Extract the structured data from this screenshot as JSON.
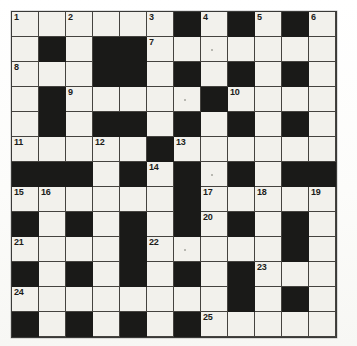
{
  "puzzle": {
    "kind": "crossword-grid",
    "title": "",
    "columns": 12,
    "rows": 13,
    "cell_size_px": 27,
    "colors": {
      "block": "#1a1a18",
      "open": "#f2f1ec",
      "grid_line": "#45433f",
      "page": "#fdfdfb",
      "number_text": "#1c1c1a"
    },
    "legend": {
      "open_cell": "white-cell",
      "block_cell": "black-cell"
    },
    "clue_numbers_present": [
      1,
      2,
      3,
      4,
      5,
      6,
      7,
      8,
      9,
      10,
      11,
      12,
      13,
      14,
      15,
      16,
      17,
      18,
      19,
      20,
      21,
      22,
      23,
      24,
      25
    ],
    "max_clue_number": 25,
    "grid": [
      [
        {
          "b": false,
          "n": "1"
        },
        {
          "b": false,
          "n": ""
        },
        {
          "b": false,
          "n": "2"
        },
        {
          "b": false,
          "n": ""
        },
        {
          "b": false,
          "n": ""
        },
        {
          "b": false,
          "n": "3"
        },
        {
          "b": true,
          "n": ""
        },
        {
          "b": false,
          "n": "4"
        },
        {
          "b": true,
          "n": ""
        },
        {
          "b": false,
          "n": "5"
        },
        {
          "b": true,
          "n": ""
        },
        {
          "b": false,
          "n": "6"
        }
      ],
      [
        {
          "b": false,
          "n": ""
        },
        {
          "b": true,
          "n": ""
        },
        {
          "b": false,
          "n": ""
        },
        {
          "b": true,
          "n": ""
        },
        {
          "b": true,
          "n": ""
        },
        {
          "b": false,
          "n": "7"
        },
        {
          "b": false,
          "n": ""
        },
        {
          "b": false,
          "n": "",
          "s": true
        },
        {
          "b": false,
          "n": ""
        },
        {
          "b": false,
          "n": ""
        },
        {
          "b": false,
          "n": ""
        },
        {
          "b": false,
          "n": ""
        }
      ],
      [
        {
          "b": false,
          "n": "8"
        },
        {
          "b": false,
          "n": ""
        },
        {
          "b": false,
          "n": ""
        },
        {
          "b": true,
          "n": ""
        },
        {
          "b": true,
          "n": ""
        },
        {
          "b": false,
          "n": ""
        },
        {
          "b": true,
          "n": ""
        },
        {
          "b": false,
          "n": ""
        },
        {
          "b": true,
          "n": ""
        },
        {
          "b": false,
          "n": ""
        },
        {
          "b": true,
          "n": ""
        },
        {
          "b": false,
          "n": ""
        }
      ],
      [
        {
          "b": false,
          "n": ""
        },
        {
          "b": true,
          "n": ""
        },
        {
          "b": false,
          "n": "9"
        },
        {
          "b": false,
          "n": ""
        },
        {
          "b": false,
          "n": ""
        },
        {
          "b": false,
          "n": ""
        },
        {
          "b": false,
          "n": "",
          "s": true
        },
        {
          "b": true,
          "n": ""
        },
        {
          "b": false,
          "n": "10"
        },
        {
          "b": false,
          "n": ""
        },
        {
          "b": false,
          "n": ""
        },
        {
          "b": false,
          "n": ""
        }
      ],
      [
        {
          "b": false,
          "n": ""
        },
        {
          "b": true,
          "n": ""
        },
        {
          "b": false,
          "n": ""
        },
        {
          "b": true,
          "n": ""
        },
        {
          "b": true,
          "n": ""
        },
        {
          "b": false,
          "n": ""
        },
        {
          "b": true,
          "n": ""
        },
        {
          "b": false,
          "n": ""
        },
        {
          "b": true,
          "n": ""
        },
        {
          "b": false,
          "n": ""
        },
        {
          "b": true,
          "n": ""
        },
        {
          "b": false,
          "n": ""
        }
      ],
      [
        {
          "b": false,
          "n": "11"
        },
        {
          "b": false,
          "n": ""
        },
        {
          "b": false,
          "n": ""
        },
        {
          "b": false,
          "n": "12"
        },
        {
          "b": false,
          "n": ""
        },
        {
          "b": true,
          "n": ""
        },
        {
          "b": false,
          "n": "13"
        },
        {
          "b": false,
          "n": ""
        },
        {
          "b": false,
          "n": ""
        },
        {
          "b": false,
          "n": ""
        },
        {
          "b": false,
          "n": ""
        },
        {
          "b": false,
          "n": ""
        }
      ],
      [
        {
          "b": true,
          "n": ""
        },
        {
          "b": true,
          "n": ""
        },
        {
          "b": true,
          "n": ""
        },
        {
          "b": false,
          "n": ""
        },
        {
          "b": true,
          "n": ""
        },
        {
          "b": false,
          "n": "14"
        },
        {
          "b": true,
          "n": ""
        },
        {
          "b": false,
          "n": "",
          "s": true
        },
        {
          "b": true,
          "n": ""
        },
        {
          "b": false,
          "n": ""
        },
        {
          "b": true,
          "n": ""
        },
        {
          "b": true,
          "n": ""
        }
      ],
      [
        {
          "b": false,
          "n": "15"
        },
        {
          "b": false,
          "n": "16"
        },
        {
          "b": false,
          "n": ""
        },
        {
          "b": false,
          "n": ""
        },
        {
          "b": false,
          "n": ""
        },
        {
          "b": false,
          "n": ""
        },
        {
          "b": true,
          "n": ""
        },
        {
          "b": false,
          "n": "17"
        },
        {
          "b": false,
          "n": ""
        },
        {
          "b": false,
          "n": "18"
        },
        {
          "b": false,
          "n": ""
        },
        {
          "b": false,
          "n": "19"
        }
      ],
      [
        {
          "b": true,
          "n": ""
        },
        {
          "b": false,
          "n": ""
        },
        {
          "b": true,
          "n": ""
        },
        {
          "b": false,
          "n": ""
        },
        {
          "b": true,
          "n": ""
        },
        {
          "b": false,
          "n": ""
        },
        {
          "b": true,
          "n": ""
        },
        {
          "b": false,
          "n": "20"
        },
        {
          "b": true,
          "n": ""
        },
        {
          "b": false,
          "n": ""
        },
        {
          "b": true,
          "n": ""
        },
        {
          "b": false,
          "n": ""
        }
      ],
      [
        {
          "b": false,
          "n": "21"
        },
        {
          "b": false,
          "n": ""
        },
        {
          "b": false,
          "n": ""
        },
        {
          "b": false,
          "n": ""
        },
        {
          "b": true,
          "n": ""
        },
        {
          "b": false,
          "n": "22"
        },
        {
          "b": false,
          "n": "",
          "s": true
        },
        {
          "b": false,
          "n": ""
        },
        {
          "b": false,
          "n": ""
        },
        {
          "b": false,
          "n": ""
        },
        {
          "b": true,
          "n": ""
        },
        {
          "b": false,
          "n": ""
        }
      ],
      [
        {
          "b": true,
          "n": ""
        },
        {
          "b": false,
          "n": ""
        },
        {
          "b": true,
          "n": ""
        },
        {
          "b": false,
          "n": ""
        },
        {
          "b": true,
          "n": ""
        },
        {
          "b": false,
          "n": ""
        },
        {
          "b": true,
          "n": ""
        },
        {
          "b": false,
          "n": ""
        },
        {
          "b": true,
          "n": ""
        },
        {
          "b": false,
          "n": "23"
        },
        {
          "b": false,
          "n": ""
        },
        {
          "b": false,
          "n": ""
        }
      ],
      [
        {
          "b": false,
          "n": "24"
        },
        {
          "b": false,
          "n": ""
        },
        {
          "b": false,
          "n": ""
        },
        {
          "b": false,
          "n": ""
        },
        {
          "b": false,
          "n": ""
        },
        {
          "b": false,
          "n": ""
        },
        {
          "b": false,
          "n": ""
        },
        {
          "b": false,
          "n": ""
        },
        {
          "b": true,
          "n": ""
        },
        {
          "b": false,
          "n": ""
        },
        {
          "b": true,
          "n": ""
        },
        {
          "b": false,
          "n": ""
        }
      ],
      [
        {
          "b": true,
          "n": ""
        },
        {
          "b": false,
          "n": ""
        },
        {
          "b": true,
          "n": ""
        },
        {
          "b": false,
          "n": ""
        },
        {
          "b": true,
          "n": ""
        },
        {
          "b": false,
          "n": ""
        },
        {
          "b": true,
          "n": ""
        },
        {
          "b": false,
          "n": "25"
        },
        {
          "b": false,
          "n": ""
        },
        {
          "b": false,
          "n": ""
        },
        {
          "b": false,
          "n": ""
        },
        {
          "b": false,
          "n": ""
        }
      ]
    ]
  }
}
